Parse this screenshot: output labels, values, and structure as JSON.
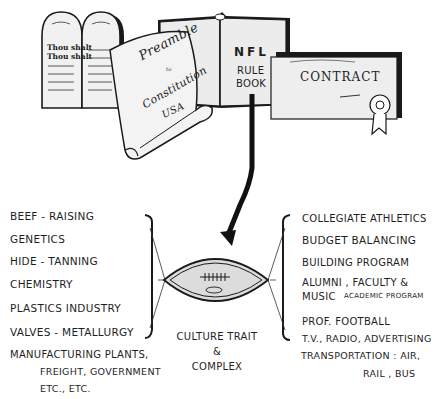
{
  "top_documents": {
    "tablets": {
      "left_lines": [
        "Thou shalt",
        "Thou shalt"
      ],
      "right_lines": []
    },
    "scroll": {
      "title": "Preamble",
      "to": "to",
      "word": "Constitution",
      "of": "of",
      "country": "USA"
    },
    "book": {
      "line1": "NFL",
      "line2": "RULE",
      "line3": "BOOK"
    },
    "contract": {
      "title": "CONTRACT"
    }
  },
  "left_column": {
    "items": [
      "BEEF - RAISING",
      "GENETICS",
      "HIDE - TANNING",
      "CHEMISTRY",
      "PLASTICS  INDUSTRY",
      "VALVES - METALLURGY"
    ],
    "manufacturing": {
      "line1": "MANUFACTURING PLANTS,",
      "line2": "FREIGHT, GOVERNMENT",
      "line3": "ETC.,  ETC."
    }
  },
  "center": {
    "caption_line1": "CULTURE TRAIT",
    "caption_line2": "&",
    "caption_line3": "COMPLEX"
  },
  "right_column": {
    "items": [
      "COLLEGIATE ATHLETICS",
      "BUDGET BALANCING",
      "BUILDING  PROGRAM",
      "ALUMNI , FACULTY &",
      "MUSIC",
      "PROF. FOOTBALL",
      "T.V., RADIO, ADVERTISING",
      "TRANSPORTATION :  AIR,",
      "RAIL , BUS"
    ],
    "academic_note": "ACADEMIC PROGRAM"
  }
}
